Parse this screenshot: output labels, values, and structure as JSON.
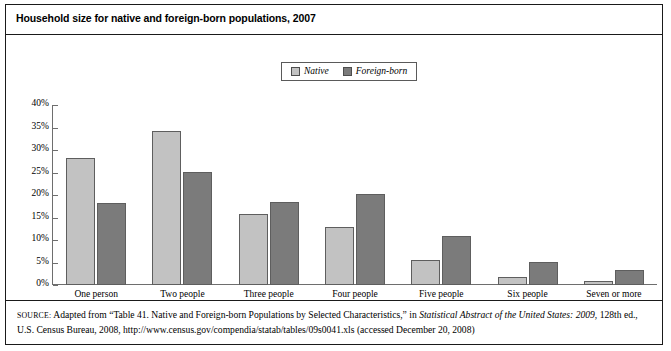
{
  "figure": {
    "title": "Household size for native and foreign-born populations, 2007",
    "source_label": "SOURCE:",
    "source_part1": " Adapted from “Table 41. Native and Foreign-born Populations by Selected Characteristics,” in ",
    "source_italic": "Statistical Abstract of the United States: 2009",
    "source_part2": ", 128th ed., U.S. Census Bureau, 2008, http://www.census.gov/compendia/statab/tables/09s0041.xls (accessed December 20, 2008)"
  },
  "legend": {
    "position": "top-center",
    "entries": [
      {
        "label": "Native",
        "color": "#c2c2c2",
        "icon": "legend-swatch-icon"
      },
      {
        "label": "Foreign-born",
        "color": "#7b7b7b",
        "icon": "legend-swatch-icon"
      }
    ]
  },
  "chart_data": {
    "type": "bar",
    "title": "Household size for native and foreign-born populations, 2007",
    "xlabel": "",
    "ylabel": "",
    "ylim": [
      0,
      40
    ],
    "yunit": "%",
    "grid": false,
    "legend_position": "top-center",
    "categories": [
      "One person",
      "Two people",
      "Three people",
      "Four people",
      "Five people",
      "Six people",
      "Seven or more"
    ],
    "ytick_labels": [
      "40%",
      "35%",
      "30%",
      "25%",
      "20%",
      "15%",
      "10%",
      "5%",
      "0%"
    ],
    "ytick_values": [
      40,
      35,
      30,
      25,
      20,
      15,
      10,
      5,
      0
    ],
    "series": [
      {
        "name": "Native",
        "color": "#c2c2c2",
        "values": [
          28.3,
          34.3,
          15.7,
          13.0,
          5.5,
          1.8,
          0.9
        ]
      },
      {
        "name": "Foreign-born",
        "color": "#7b7b7b",
        "values": [
          18.2,
          25.2,
          18.4,
          20.2,
          10.9,
          5.2,
          3.4
        ]
      }
    ]
  }
}
